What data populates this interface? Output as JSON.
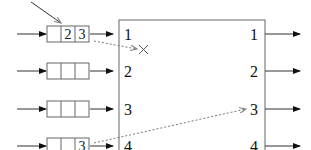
{
  "diagram": {
    "type": "input-queued switch with head-of-line blocking",
    "switch": {
      "input_ports": [
        "1",
        "2",
        "3",
        "4"
      ],
      "output_ports": [
        "1",
        "2",
        "3",
        "4"
      ]
    },
    "input_queues": [
      {
        "port": "1",
        "cells": [
          "",
          "2",
          "3"
        ]
      },
      {
        "port": "2",
        "cells": [
          "",
          "",
          ""
        ]
      },
      {
        "port": "3",
        "cells": [
          "",
          "",
          ""
        ]
      },
      {
        "port": "4",
        "cells": [
          "",
          "",
          "3"
        ]
      }
    ],
    "annotations": {
      "blocked_mark": "×",
      "blocked_from_queue": "1",
      "forward_from_queue": "4",
      "forward_to_output": "3"
    }
  }
}
